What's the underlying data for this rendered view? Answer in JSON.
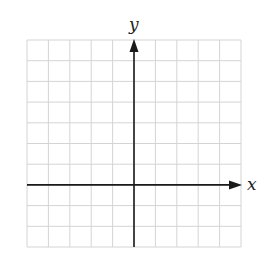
{
  "diagram": {
    "type": "coordinate-grid",
    "x_axis_label": "x",
    "y_axis_label": "y",
    "grid": {
      "columns": 10,
      "rows": 10,
      "left": 27,
      "top": 40,
      "right": 241,
      "bottom": 247,
      "line_color": "#d4d4d4"
    },
    "axes": {
      "y_axis_column": 5,
      "x_axis_row": 7,
      "color": "#1a1a1a"
    }
  }
}
